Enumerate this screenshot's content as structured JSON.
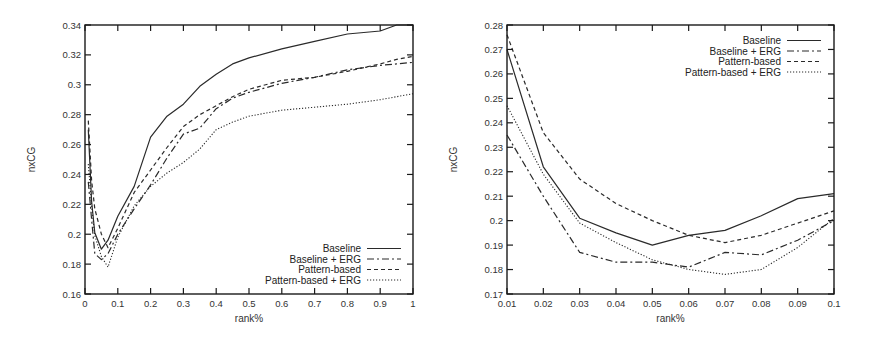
{
  "chart_data": [
    {
      "type": "line",
      "title": "",
      "xlabel": "rank%",
      "ylabel": "nxCG",
      "xlim": [
        0,
        1
      ],
      "ylim": [
        0.16,
        0.34
      ],
      "grid": false,
      "legend_position": "lower right",
      "x_ticks": [
        "0",
        "0.1",
        "0.2",
        "0.3",
        "0.4",
        "0.5",
        "0.6",
        "0.7",
        "0.8",
        "0.9",
        "1"
      ],
      "y_ticks": [
        "0.16",
        "0.18",
        "0.2",
        "0.22",
        "0.24",
        "0.26",
        "0.28",
        "0.3",
        "0.32",
        "0.34"
      ],
      "x": [
        0.01,
        0.02,
        0.03,
        0.05,
        0.07,
        0.1,
        0.15,
        0.2,
        0.25,
        0.3,
        0.35,
        0.4,
        0.45,
        0.5,
        0.6,
        0.7,
        0.8,
        0.9,
        0.95,
        1.0
      ],
      "series": [
        {
          "name": "Baseline",
          "style": "solid",
          "values": [
            0.27,
            0.222,
            0.201,
            0.19,
            0.196,
            0.212,
            0.232,
            0.265,
            0.279,
            0.287,
            0.299,
            0.307,
            0.314,
            0.318,
            0.324,
            0.329,
            0.334,
            0.336,
            0.34,
            0.34
          ]
        },
        {
          "name": "Baseline + ERG",
          "style": "dash-dot",
          "values": [
            0.235,
            0.21,
            0.187,
            0.183,
            0.187,
            0.2,
            0.217,
            0.233,
            0.251,
            0.267,
            0.271,
            0.284,
            0.291,
            0.295,
            0.301,
            0.305,
            0.31,
            0.313,
            0.314,
            0.315
          ]
        },
        {
          "name": "Pattern-based",
          "style": "dashed",
          "values": [
            0.276,
            0.236,
            0.217,
            0.2,
            0.191,
            0.204,
            0.228,
            0.243,
            0.258,
            0.272,
            0.28,
            0.286,
            0.292,
            0.297,
            0.303,
            0.305,
            0.309,
            0.314,
            0.317,
            0.319
          ]
        },
        {
          "name": "Pattern-based + ERG",
          "style": "dotted",
          "values": [
            0.247,
            0.219,
            0.199,
            0.185,
            0.178,
            0.198,
            0.219,
            0.232,
            0.241,
            0.248,
            0.257,
            0.27,
            0.275,
            0.279,
            0.283,
            0.285,
            0.287,
            0.29,
            0.292,
            0.294
          ]
        }
      ]
    },
    {
      "type": "line",
      "title": "",
      "xlabel": "rank%",
      "ylabel": "nxCG",
      "xlim": [
        0.01,
        0.1
      ],
      "ylim": [
        0.17,
        0.28
      ],
      "grid": false,
      "legend_position": "upper right",
      "x_ticks": [
        "0.01",
        "0.02",
        "0.03",
        "0.04",
        "0.05",
        "0.06",
        "0.07",
        "0.08",
        "0.09",
        "0.1"
      ],
      "y_ticks": [
        "0.17",
        "0.18",
        "0.19",
        "0.2",
        "0.21",
        "0.22",
        "0.23",
        "0.24",
        "0.25",
        "0.26",
        "0.27",
        "0.28"
      ],
      "x": [
        0.01,
        0.02,
        0.03,
        0.04,
        0.05,
        0.06,
        0.07,
        0.08,
        0.09,
        0.1
      ],
      "series": [
        {
          "name": "Baseline",
          "style": "solid",
          "values": [
            0.27,
            0.222,
            0.201,
            0.195,
            0.19,
            0.194,
            0.196,
            0.202,
            0.209,
            0.211
          ]
        },
        {
          "name": "Baseline + ERG",
          "style": "dash-dot",
          "values": [
            0.235,
            0.21,
            0.187,
            0.183,
            0.183,
            0.181,
            0.187,
            0.186,
            0.192,
            0.2
          ]
        },
        {
          "name": "Pattern-based",
          "style": "dashed",
          "values": [
            0.276,
            0.236,
            0.217,
            0.207,
            0.2,
            0.194,
            0.191,
            0.194,
            0.199,
            0.204
          ]
        },
        {
          "name": "Pattern-based + ERG",
          "style": "dotted",
          "values": [
            0.247,
            0.219,
            0.199,
            0.191,
            0.184,
            0.18,
            0.178,
            0.18,
            0.189,
            0.201
          ]
        }
      ]
    }
  ],
  "legend": {
    "baseline": "Baseline",
    "baseline_erg": "Baseline + ERG",
    "pattern": "Pattern-based",
    "pattern_erg": "Pattern-based + ERG"
  },
  "colors": {
    "line": "#2a2a2a",
    "axis": "#1a1a1a"
  }
}
